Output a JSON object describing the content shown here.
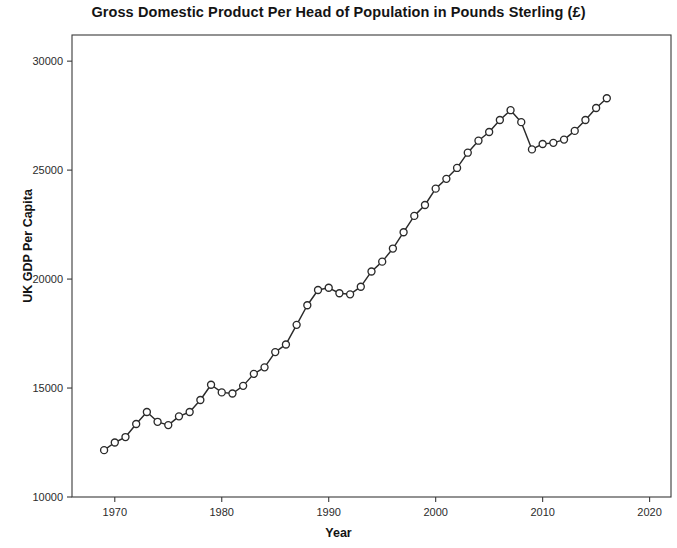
{
  "chart_data": {
    "type": "line",
    "title": "Gross Domestic Product Per Head of Population in Pounds Sterling (£)",
    "xlabel": "Year",
    "ylabel": "UK GDP Per Capita",
    "xlim": [
      1966,
      2022
    ],
    "ylim": [
      10000,
      31200
    ],
    "xticks": [
      1970,
      1980,
      1990,
      2000,
      2010,
      2020
    ],
    "xticklabels": [
      "1970",
      "1980",
      "1990",
      "2000",
      "2010",
      "2020"
    ],
    "yticks": [
      10000,
      15000,
      20000,
      25000,
      30000
    ],
    "yticklabels": [
      "10000",
      "15000",
      "20000",
      "25000",
      "30000"
    ],
    "grid": false,
    "legend": null,
    "marker": "open-circle",
    "line_color": "#2a2a2a",
    "marker_face_color": "#ffffff",
    "series": [
      {
        "name": "UK GDP Per Capita",
        "x": [
          1969,
          1970,
          1971,
          1972,
          1973,
          1974,
          1975,
          1976,
          1977,
          1978,
          1979,
          1980,
          1981,
          1982,
          1983,
          1984,
          1985,
          1986,
          1987,
          1988,
          1989,
          1990,
          1991,
          1992,
          1993,
          1994,
          1995,
          1996,
          1997,
          1998,
          1999,
          2000,
          2001,
          2002,
          2003,
          2004,
          2005,
          2006,
          2007,
          2008,
          2009,
          2010,
          2011,
          2012,
          2013,
          2014,
          2015,
          2016
        ],
        "values": [
          12150,
          12500,
          12750,
          13350,
          13900,
          13450,
          13300,
          13700,
          13900,
          14450,
          15150,
          14800,
          14750,
          15100,
          15650,
          15950,
          16650,
          17000,
          17900,
          18800,
          19500,
          19600,
          19350,
          19300,
          19650,
          20350,
          20800,
          21400,
          22150,
          22900,
          23400,
          24150,
          24600,
          25100,
          25800,
          26350,
          26750,
          27300,
          27750,
          27200,
          25950,
          26200,
          26250,
          26400,
          26800,
          27300,
          27850,
          28300
        ]
      }
    ]
  },
  "axes": {
    "y_tick_label_0": "10000",
    "y_tick_label_1": "15000",
    "y_tick_label_2": "20000",
    "y_tick_label_3": "25000",
    "y_tick_label_4": "30000",
    "x_tick_label_0": "1970",
    "x_tick_label_1": "1980",
    "x_tick_label_2": "1990",
    "x_tick_label_3": "2000",
    "x_tick_label_4": "2010",
    "x_tick_label_5": "2020"
  }
}
